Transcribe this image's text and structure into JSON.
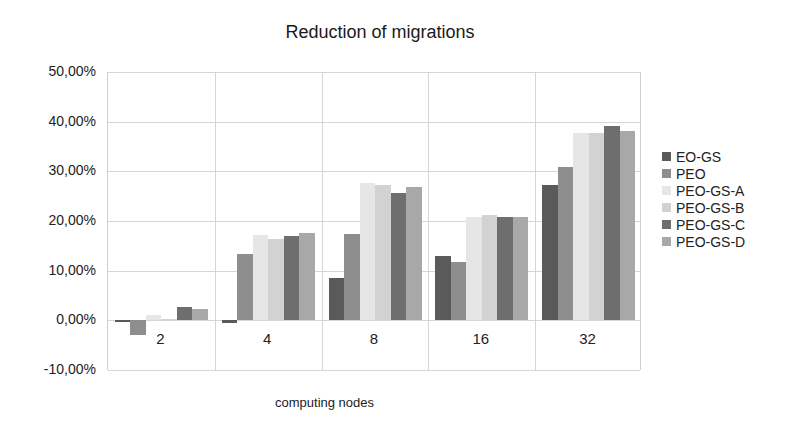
{
  "chart_data": {
    "type": "bar",
    "title": "Reduction of migrations",
    "xlabel": "computing nodes",
    "ylabel": "",
    "categories": [
      "2",
      "4",
      "8",
      "16",
      "32"
    ],
    "ylim": [
      -0.1,
      0.5
    ],
    "yticks": [
      "50,00%",
      "40,00%",
      "30,00%",
      "20,00%",
      "10,00%",
      "0,00%",
      "-10,00%"
    ],
    "grid": true,
    "legend_position": "right",
    "series": [
      {
        "name": "EO-GS",
        "color": "#5a5a5a",
        "values": [
          -0.004,
          -0.005,
          0.085,
          0.129,
          0.272
        ]
      },
      {
        "name": "PEO",
        "color": "#8e8e8e",
        "values": [
          -0.029,
          0.133,
          0.173,
          0.117,
          0.308
        ]
      },
      {
        "name": "PEO-GS-A",
        "color": "#e6e6e6",
        "values": [
          0.01,
          0.171,
          0.276,
          0.209,
          0.378
        ]
      },
      {
        "name": "PEO-GS-B",
        "color": "#d2d2d2",
        "values": [
          0.002,
          0.163,
          0.272,
          0.213,
          0.378
        ]
      },
      {
        "name": "PEO-GS-C",
        "color": "#6e6e6e",
        "values": [
          0.026,
          0.169,
          0.256,
          0.209,
          0.392
        ]
      },
      {
        "name": "PEO-GS-D",
        "color": "#a8a8a8",
        "values": [
          0.022,
          0.175,
          0.268,
          0.209,
          0.382
        ]
      }
    ]
  }
}
